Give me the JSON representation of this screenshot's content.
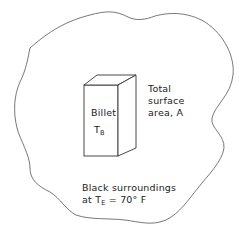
{
  "diagram": {
    "billet": {
      "name": "Billet",
      "temp_symbol": "T",
      "temp_subscript": "B"
    },
    "surface": {
      "line1": "Total",
      "line2": "surface",
      "line3": "area, A"
    },
    "surroundings": {
      "line1": "Black surroundings",
      "line2_prefix": "at",
      "temp_symbol": "T",
      "temp_subscript": "E",
      "temp_value": "= 70° F"
    },
    "colors": {
      "stroke": "#555555",
      "text": "#222222",
      "background": "#ffffff"
    }
  }
}
